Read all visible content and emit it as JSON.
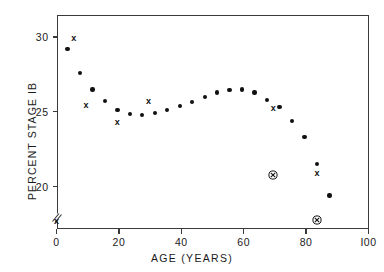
{
  "chart_data": {
    "type": "scatter",
    "title": "",
    "subtitle": "",
    "xlabel": "AGE (YEARS)",
    "ylabel": "PERCENT STAGE IB",
    "xlim": [
      0,
      100
    ],
    "ylim": [
      17.2,
      31.5
    ],
    "xticks": [
      0,
      20,
      40,
      60,
      80,
      100
    ],
    "xticklabels": [
      "0",
      "20",
      "40",
      "60",
      "80",
      "I00"
    ],
    "yticks": [
      20,
      25,
      30
    ],
    "yticklabels": [
      "20",
      "25",
      "30"
    ],
    "grid": false,
    "legend": null,
    "axis_break": {
      "axis": "y",
      "position": 17.9,
      "symbol": "double-slash"
    },
    "series": [
      {
        "name": "filled-dot",
        "marker": "filled circle",
        "color": "#111111",
        "points": [
          {
            "x": 3.5,
            "y": 29.2
          },
          {
            "x": 7.5,
            "y": 27.6
          },
          {
            "x": 11.5,
            "y": 26.5
          },
          {
            "x": 15.5,
            "y": 25.7
          },
          {
            "x": 19.5,
            "y": 25.1
          },
          {
            "x": 23.5,
            "y": 24.85
          },
          {
            "x": 27.5,
            "y": 24.8
          },
          {
            "x": 31.5,
            "y": 24.9
          },
          {
            "x": 35.5,
            "y": 25.1
          },
          {
            "x": 39.5,
            "y": 25.4
          },
          {
            "x": 43.5,
            "y": 25.65
          },
          {
            "x": 47.5,
            "y": 26.0
          },
          {
            "x": 51.5,
            "y": 26.3
          },
          {
            "x": 55.5,
            "y": 26.45
          },
          {
            "x": 59.5,
            "y": 26.5
          },
          {
            "x": 63.5,
            "y": 26.3
          },
          {
            "x": 67.5,
            "y": 25.8
          },
          {
            "x": 71.5,
            "y": 25.3
          },
          {
            "x": 75.5,
            "y": 24.4
          },
          {
            "x": 79.5,
            "y": 23.3
          },
          {
            "x": 83.5,
            "y": 21.5
          },
          {
            "x": 87.5,
            "y": 19.4
          }
        ]
      },
      {
        "name": "x-marker",
        "marker": "x",
        "color": "#111111",
        "points": [
          {
            "x": 5.5,
            "y": 29.9
          },
          {
            "x": 9.5,
            "y": 25.4
          },
          {
            "x": 19.5,
            "y": 24.3
          },
          {
            "x": 29.5,
            "y": 25.7
          },
          {
            "x": 69.5,
            "y": 25.2
          },
          {
            "x": 83.5,
            "y": 20.9
          },
          {
            "x": 0.0,
            "y": 17.7
          }
        ]
      },
      {
        "name": "circled-x-marker",
        "marker": "circled x",
        "color": "#111111",
        "points": [
          {
            "x": 69.5,
            "y": 20.8
          },
          {
            "x": 83.5,
            "y": 17.75
          }
        ]
      }
    ]
  },
  "colors": {
    "marker": "#111111",
    "axis": "#3a3a3a",
    "text": "#1a1a1a",
    "background": "#ffffff"
  }
}
